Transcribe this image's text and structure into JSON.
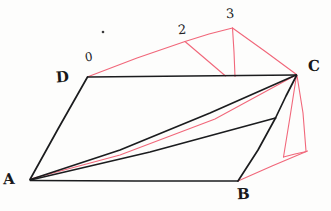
{
  "figure": {
    "background_color": "#fdfdfc",
    "stroke_colors": {
      "solid": "#1b1c1e",
      "construction": "#f1677a"
    },
    "vertices": {
      "A": {
        "label": "A",
        "x": 30,
        "y": 180
      },
      "B": {
        "label": "B",
        "x": 238,
        "y": 181
      },
      "C": {
        "label": "C",
        "x": 297,
        "y": 75
      },
      "D": {
        "label": "D",
        "x": 88,
        "y": 77
      },
      "P0": {
        "label": "0",
        "x": 88,
        "y": 77
      },
      "P2": {
        "label": "2",
        "x": 185,
        "y": 41
      },
      "P3": {
        "label": "3",
        "x": 232,
        "y": 28
      }
    },
    "labels": {
      "A": "A",
      "B": "B",
      "C": "C",
      "D": "D",
      "zero": "0",
      "two": "2",
      "three": "3"
    },
    "black_edges": [
      {
        "name": "edge-A-D",
        "from": "A",
        "to": "D"
      },
      {
        "name": "edge-D-C",
        "from": "D",
        "to": "C"
      },
      {
        "name": "edge-A-C",
        "from": "A",
        "to": "C"
      },
      {
        "name": "edge-A-B",
        "from": "A",
        "to": "B"
      },
      {
        "name": "edge-B-C",
        "from": "B",
        "to": "C"
      },
      {
        "name": "edge-A-M",
        "from": "A",
        "to": "M"
      },
      {
        "name": "edge-M-C",
        "from": "M",
        "to": "C"
      }
    ],
    "red_edges": [
      {
        "name": "red-D-2",
        "from": "P0",
        "to": "P2"
      },
      {
        "name": "red-2-3",
        "from": "P2",
        "to": "P3"
      },
      {
        "name": "red-3-C",
        "from": "P3",
        "to": "C"
      },
      {
        "name": "red-2-drop",
        "from": "P2",
        "to": "F"
      },
      {
        "name": "red-3-drop",
        "from": "P3",
        "to": "G"
      },
      {
        "name": "red-A-C",
        "from": "A",
        "to": "C"
      },
      {
        "name": "red-C-H",
        "from": "C",
        "to": "H"
      },
      {
        "name": "red-C-K",
        "from": "C",
        "to": "K"
      },
      {
        "name": "red-B-K",
        "from": "B",
        "to": "K"
      },
      {
        "name": "red-H-K",
        "from": "H",
        "to": "K"
      }
    ],
    "dot": {
      "name": "stray-ink-dot",
      "x": 103,
      "y": 32,
      "r": 1.4
    }
  }
}
